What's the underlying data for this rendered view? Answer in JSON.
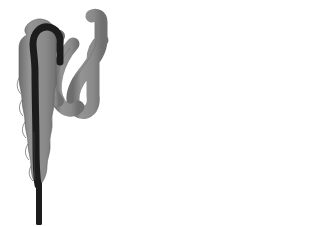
{
  "figure": {
    "title": "Everting organ expansion sequence",
    "background_color": "#ffffff",
    "width": 319,
    "height": 227,
    "panel_count": 2,
    "connector_count": 2
  },
  "palette": {
    "sheath_gray": "#8c8c8c",
    "sheath_gray_light": "#a6a6a6",
    "sheath_gray_dark": "#6e6e6e",
    "core_dark": "#1c1c1c",
    "fan_fill": "#e9e9e9",
    "fan_line": "#555555",
    "highlight_white": "#f2f2f2",
    "outline_arrow_stroke": "#c9c9c9",
    "pressure_arrow": "#2b2b2b",
    "outline_stroke": "#4a4a4a"
  },
  "panels": [
    {
      "id": "panel-left",
      "label": "Retracted state",
      "description": "Dark core tube inside scalloped gray sheath with folded coiled distal segment",
      "parts": [
        {
          "name": "scalloped-sheath",
          "label": "Scalloped sheath",
          "color": "#8c8c8c"
        },
        {
          "name": "core-tube",
          "label": "Dark core tube",
          "color": "#1c1c1c"
        },
        {
          "name": "folded-coil",
          "label": "Folded coil segment",
          "color": "#8c8c8c"
        },
        {
          "name": "basal-stem",
          "label": "Basal stem",
          "color": "#1c1c1c"
        }
      ]
    },
    {
      "id": "panel-right",
      "label": "Everted state",
      "description": "Expanded dome with radiating fan of fibers, hooked distal tube, and inflow arrow",
      "fan_ray_count": 21,
      "parts": [
        {
          "name": "expanded-dome",
          "label": "Expanded dome",
          "color": "#8c8c8c"
        },
        {
          "name": "fan-membrane",
          "label": "Radiating fan membrane",
          "color": "#e9e9e9"
        },
        {
          "name": "hooked-tube",
          "label": "Hooked distal tube",
          "color": "#8c8c8c"
        },
        {
          "name": "core-tube",
          "label": "Dark core tube",
          "color": "#1c1c1c"
        },
        {
          "name": "basal-stem",
          "label": "Basal stem",
          "color": "#1c1c1c"
        },
        {
          "name": "pressure-arrow",
          "label": "Upward pressure arrow",
          "color": "#2b2b2b"
        }
      ]
    }
  ],
  "connectors": [
    {
      "name": "sequence-arrow-1",
      "label": "Step arrow 1",
      "direction": "right",
      "style": "outline"
    },
    {
      "name": "sequence-arrow-2",
      "label": "Step arrow 2",
      "direction": "right",
      "style": "outline"
    }
  ],
  "captions": {
    "left_stage": "",
    "right_stage": "",
    "inflow": ""
  }
}
